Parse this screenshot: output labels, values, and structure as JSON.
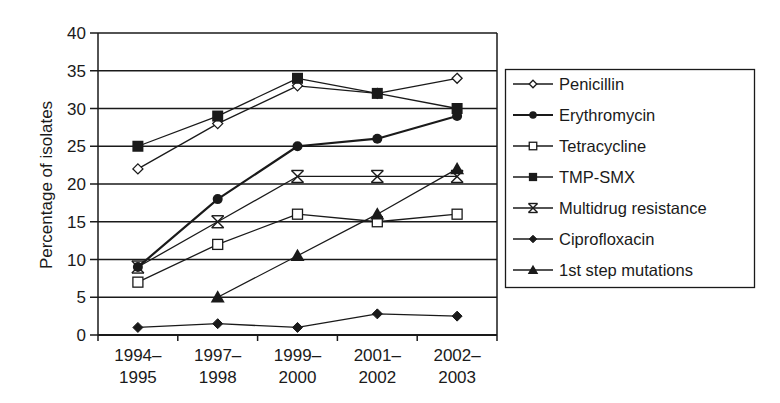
{
  "chart_data": {
    "type": "line",
    "title": "",
    "xlabel": "",
    "ylabel": "Percentage of isolates",
    "ylim": [
      0,
      40
    ],
    "yticks": [
      0,
      5,
      10,
      15,
      20,
      25,
      30,
      35,
      40
    ],
    "grid": true,
    "legend_position": "right",
    "categories": [
      "1994–\n1995",
      "1997–\n1998",
      "1999–\n2000",
      "2001–\n2002",
      "2002–\n2003"
    ],
    "category_lines": [
      [
        "1994–",
        "1995"
      ],
      [
        "1997–",
        "1998"
      ],
      [
        "1999–",
        "2000"
      ],
      [
        "2001–",
        "2002"
      ],
      [
        "2002–",
        "2003"
      ]
    ],
    "series": [
      {
        "name": "Penicillin",
        "marker": "diamond-open",
        "line_width": 1.3,
        "values": [
          22,
          28,
          33,
          32,
          34
        ]
      },
      {
        "name": "Erythromycin",
        "marker": "circle-filled",
        "line_width": 2.2,
        "values": [
          9,
          18,
          25,
          26,
          29
        ]
      },
      {
        "name": "Tetracycline",
        "marker": "square-open",
        "line_width": 1.3,
        "values": [
          7,
          12,
          16,
          15,
          16
        ]
      },
      {
        "name": "TMP-SMX",
        "marker": "square-filled",
        "line_width": 1.3,
        "values": [
          25,
          29,
          34,
          32,
          30
        ]
      },
      {
        "name": "Multidrug resistance",
        "marker": "asterisk",
        "line_width": 1.3,
        "values": [
          9,
          15,
          21,
          21,
          21
        ]
      },
      {
        "name": "Ciprofloxacin",
        "marker": "diamond-filled",
        "line_width": 1.3,
        "values": [
          1,
          1.5,
          1,
          2.8,
          2.5
        ]
      },
      {
        "name": "1st step mutations",
        "marker": "triangle-filled",
        "line_width": 1.3,
        "values": [
          null,
          5,
          10.5,
          16,
          22
        ]
      }
    ]
  },
  "colors": {
    "line": "#1a1a1a",
    "grid": "#1a1a1a",
    "background": "#ffffff"
  }
}
